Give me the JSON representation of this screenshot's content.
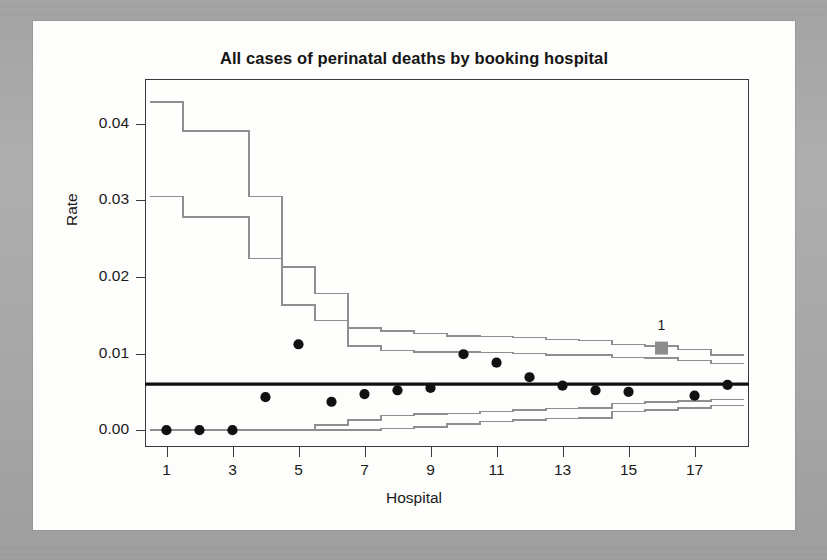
{
  "figure": {
    "title": "All cases of perinatal deaths by booking hospital",
    "xlabel": "Hospital",
    "ylabel": "Rate",
    "annotation_label": "1"
  },
  "colors": {
    "paper": "#fdfdfb",
    "mat": "#a8a8a8",
    "frame": "#3a3a3a",
    "point": "#111111",
    "center_line": "#101010",
    "control_limit": "#8e8e8e",
    "highlight_marker": "#8c8c8c",
    "text": "#1a1a1a"
  },
  "axes": {
    "y_ticks": [
      "0.00",
      "0.01",
      "0.02",
      "0.03",
      "0.04"
    ],
    "y_tick_values": [
      0.0,
      0.01,
      0.02,
      0.03,
      0.04
    ],
    "x_ticks": [
      "1",
      "3",
      "5",
      "7",
      "9",
      "11",
      "13",
      "15",
      "17"
    ],
    "x_tick_values": [
      1,
      3,
      5,
      7,
      9,
      11,
      13,
      15,
      17
    ],
    "xlim": [
      0.35,
      18.65
    ],
    "ylim": [
      -0.0022,
      0.0458
    ],
    "grid": false
  },
  "chart_data": {
    "type": "scatter",
    "title": "All cases of perinatal deaths by booking hospital",
    "subtitle": "",
    "xlabel": "Hospital",
    "ylabel": "Rate",
    "xlim": [
      0.35,
      18.65
    ],
    "ylim": [
      -0.0022,
      0.0458
    ],
    "grid": false,
    "legend": "none",
    "x": [
      1,
      2,
      3,
      4,
      5,
      6,
      7,
      8,
      9,
      10,
      11,
      12,
      13,
      14,
      15,
      16,
      17,
      18
    ],
    "series": [
      {
        "name": "Observed rate",
        "marker": "filled-circle",
        "values": [
          0.0,
          0.0,
          0.0,
          0.0043,
          0.0112,
          0.0037,
          0.0047,
          0.0052,
          0.0055,
          0.0099,
          0.0088,
          0.0069,
          0.0058,
          0.0052,
          0.005,
          0.0107,
          0.0045,
          0.0059
        ]
      },
      {
        "name": "Target (overall rate)",
        "type": "line",
        "style": "thick-solid",
        "value": 0.006
      },
      {
        "name": "Upper 99.8% limit",
        "type": "step",
        "values": [
          0.0428,
          0.039,
          0.039,
          0.0305,
          0.0213,
          0.0178,
          0.0133,
          0.0129,
          0.0126,
          0.0123,
          0.0122,
          0.0121,
          0.0118,
          0.0117,
          0.0112,
          0.011,
          0.0105,
          0.0098
        ]
      },
      {
        "name": "Upper 95% limit",
        "type": "step",
        "values": [
          0.0305,
          0.0278,
          0.0278,
          0.0224,
          0.0163,
          0.0143,
          0.011,
          0.0104,
          0.0102,
          0.0102,
          0.0101,
          0.01,
          0.0098,
          0.0098,
          0.0095,
          0.0094,
          0.0091,
          0.0087
        ]
      },
      {
        "name": "Lower 95% limit",
        "type": "step",
        "values": [
          0.0,
          0.0,
          0.0,
          0.0,
          0.0,
          0.0007,
          0.0013,
          0.0019,
          0.0021,
          0.0022,
          0.0024,
          0.0026,
          0.0028,
          0.0029,
          0.0035,
          0.0037,
          0.0038,
          0.004
        ]
      },
      {
        "name": "Lower 99.8% limit",
        "type": "step",
        "values": [
          0.0,
          0.0,
          0.0,
          0.0,
          0.0,
          0.0,
          0.0,
          0.0002,
          0.0004,
          0.0008,
          0.0011,
          0.0013,
          0.0015,
          0.0016,
          0.0024,
          0.0026,
          0.0029,
          0.0032
        ]
      }
    ],
    "annotations": [
      {
        "label": "1",
        "x": 16,
        "y": 0.0107,
        "marker": "filled-square",
        "color": "#8c8c8c",
        "note": "flagged hospital above upper control limit"
      }
    ]
  }
}
